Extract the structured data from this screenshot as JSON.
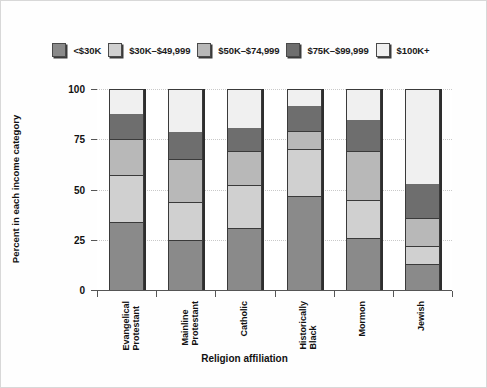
{
  "chart_data": {
    "type": "bar",
    "subtype": "stacked-bar-100",
    "title": "",
    "xlabel": "Religion affiliation",
    "ylabel": "Percent in each income category",
    "ylim": [
      0,
      100
    ],
    "yticks": [
      0,
      25,
      50,
      75,
      100
    ],
    "grid": true,
    "legend_position": "top",
    "categories": [
      "Evangelical\nProtestant",
      "Mainline\nProtestant",
      "Catholic",
      "Historically\nBlack",
      "Mormon",
      "Jewish"
    ],
    "series": [
      {
        "name": "<$30K",
        "color": "#8a8a8a",
        "values": [
          34,
          25,
          31,
          47,
          26,
          13
        ]
      },
      {
        "name": "$30K–$49,999",
        "color": "#d0d0d0",
        "values": [
          23,
          19,
          21,
          23,
          19,
          9
        ]
      },
      {
        "name": "$50K–$74,999",
        "color": "#b8b8b8",
        "values": [
          18,
          21,
          17,
          9,
          24,
          14
        ]
      },
      {
        "name": "$75K–$99,999",
        "color": "#6e6e6e",
        "values": [
          13,
          14,
          12,
          13,
          16,
          17
        ]
      },
      {
        "name": "$100K+",
        "color": "#f0f0f0",
        "values": [
          12,
          21,
          19,
          8,
          15,
          47
        ]
      }
    ]
  },
  "legend": {
    "items": [
      {
        "label": "<$30K"
      },
      {
        "label": "$30K–$49,999"
      },
      {
        "label": "$50K–$74,999"
      },
      {
        "label": "$75K–$99,999"
      },
      {
        "label": "$100K+"
      }
    ]
  },
  "axes": {
    "y_title": "Percent in each income category",
    "x_title": "Religion affiliation",
    "y_tick_labels": [
      "0",
      "25",
      "50",
      "75",
      "100"
    ]
  }
}
